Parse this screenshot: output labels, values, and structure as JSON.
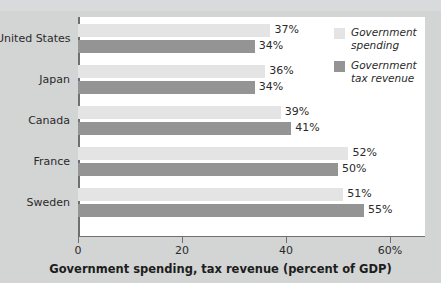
{
  "title_strip": {
    "cut_text": ""
  },
  "axis": {
    "x_title": "Government spending, tax revenue (percent of GDP)",
    "ticks": [
      {
        "value": 0,
        "label": "0"
      },
      {
        "value": 20,
        "label": "20"
      },
      {
        "value": 40,
        "label": "40"
      },
      {
        "value": 60,
        "label": "60%"
      }
    ]
  },
  "legend": {
    "position": "top-right",
    "items": [
      {
        "key": "spending",
        "label": "Government spending",
        "color": "#e4e4e4"
      },
      {
        "key": "taxrev",
        "label": "Government tax revenue",
        "color": "#949494"
      }
    ]
  },
  "chart_data": {
    "type": "bar",
    "orientation": "horizontal",
    "title": "",
    "xlabel": "Government spending, tax revenue (percent of GDP)",
    "ylabel": "",
    "xlim": [
      0,
      65
    ],
    "grid": false,
    "legend_position": "top-right",
    "categories": [
      "United States",
      "Japan",
      "Canada",
      "France",
      "Sweden"
    ],
    "series": [
      {
        "name": "Government spending",
        "color": "#e4e4e4",
        "values": [
          37,
          36,
          39,
          52,
          51
        ],
        "labels": [
          "37%",
          "36%",
          "39%",
          "52%",
          "51%"
        ]
      },
      {
        "name": "Government tax revenue",
        "color": "#949494",
        "values": [
          34,
          34,
          41,
          50,
          55
        ],
        "labels": [
          "34%",
          "34%",
          "41%",
          "50%",
          "55%"
        ]
      }
    ]
  },
  "colors": {
    "page_background": "#d3d4d4",
    "panel_background": "#ffffff",
    "axis_line": "#6e6f70",
    "text": "#2a2a2a",
    "spending_bar": "#e4e4e4",
    "tax_revenue_bar": "#949494"
  }
}
